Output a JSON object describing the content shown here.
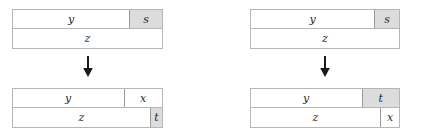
{
  "diagram": {
    "colors": {
      "shaded_cell": "#dcdcdc",
      "cell_background": "#ffffff",
      "border": "#b6b6b6",
      "inner_divider": "#9a9a9a",
      "label_text": "#2a2a2a",
      "arrow": "#1a1a1a"
    },
    "groups": [
      {
        "id": "left",
        "arrow_glyph": "↓",
        "before": {
          "rows": [
            {
              "id": "before-top-row",
              "cells": [
                {
                  "label": "y",
                  "width": 118,
                  "shaded": false,
                  "divider": false
                },
                {
                  "label": "s",
                  "width": 33,
                  "shaded": true,
                  "divider": true
                }
              ]
            },
            {
              "id": "before-bottom-row",
              "cells": [
                {
                  "label": "z",
                  "width": 151,
                  "shaded": false,
                  "divider": false
                }
              ]
            }
          ]
        },
        "after": {
          "rows": [
            {
              "id": "after-top-row",
              "cells": [
                {
                  "label": "y",
                  "width": 112,
                  "shaded": false,
                  "divider": false
                },
                {
                  "label": "x",
                  "width": 39,
                  "shaded": false,
                  "divider": true
                }
              ]
            },
            {
              "id": "after-bottom-row",
              "cells": [
                {
                  "label": "z",
                  "width": 139,
                  "shaded": false,
                  "divider": false
                },
                {
                  "label": "t",
                  "width": 12,
                  "shaded": true,
                  "divider": true
                }
              ]
            }
          ]
        }
      },
      {
        "id": "right",
        "arrow_glyph": "↓",
        "before": {
          "rows": [
            {
              "id": "before-top-row",
              "cells": [
                {
                  "label": "y",
                  "width": 125,
                  "shaded": false,
                  "divider": false
                },
                {
                  "label": "s",
                  "width": 25,
                  "shaded": true,
                  "divider": true
                }
              ]
            },
            {
              "id": "before-bottom-row",
              "cells": [
                {
                  "label": "z",
                  "width": 150,
                  "shaded": false,
                  "divider": false
                }
              ]
            }
          ]
        },
        "after": {
          "rows": [
            {
              "id": "after-top-row",
              "cells": [
                {
                  "label": "y",
                  "width": 112,
                  "shaded": false,
                  "divider": false
                },
                {
                  "label": "t",
                  "width": 38,
                  "shaded": true,
                  "divider": true
                }
              ]
            },
            {
              "id": "after-bottom-row",
              "cells": [
                {
                  "label": "z",
                  "width": 131,
                  "shaded": false,
                  "divider": false
                },
                {
                  "label": "x",
                  "width": 19,
                  "shaded": false,
                  "divider": true
                }
              ]
            }
          ]
        }
      }
    ]
  }
}
